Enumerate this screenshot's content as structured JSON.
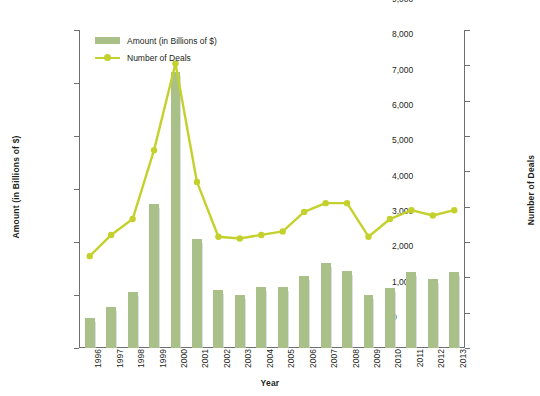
{
  "chart_data": {
    "type": "bar",
    "title": "",
    "xlabel": "Year",
    "ylabel": "Amount (in Billions of $)",
    "y2label": "Number of Deals",
    "grid": false,
    "legend_position": "top-left",
    "categories": [
      "1996",
      "1997",
      "1998",
      "1999",
      "2000",
      "2001",
      "2002",
      "2003",
      "2004",
      "2005",
      "2006",
      "2007",
      "2008",
      "2009",
      "2010",
      "2011",
      "2012",
      "2013"
    ],
    "ylim": [
      0,
      120
    ],
    "y2lim": [
      0,
      9000
    ],
    "y_ticks": [
      "$0",
      "$20",
      "$40",
      "$60",
      "$80",
      "$100",
      "$120"
    ],
    "y_tick_values": [
      0,
      20,
      40,
      60,
      80,
      100,
      120
    ],
    "y2_ticks": [
      "0",
      "1,000",
      "2,000",
      "3,000",
      "4,000",
      "5,000",
      "6,000",
      "7,000",
      "8,000",
      "9,000"
    ],
    "y2_tick_values": [
      0,
      1000,
      2000,
      3000,
      4000,
      5000,
      6000,
      7000,
      8000,
      9000
    ],
    "series": [
      {
        "name": "Amount (in Billions of $)",
        "type": "bar",
        "axis": "left",
        "color": "#a9c189",
        "values": [
          11.5,
          15.5,
          21.0,
          54.5,
          104.0,
          41.0,
          22.0,
          20.0,
          23.0,
          23.0,
          27.0,
          32.0,
          29.0,
          20.0,
          22.5,
          28.5,
          26.0,
          28.5
        ]
      },
      {
        "name": "Number of Deals",
        "type": "line",
        "axis": "right",
        "color": "#c4d12d",
        "values": [
          2600,
          3200,
          3650,
          5600,
          8050,
          4700,
          3150,
          3100,
          3200,
          3300,
          3850,
          4100,
          4100,
          3150,
          3650,
          3900,
          3750,
          3900
        ]
      }
    ]
  },
  "legend": {
    "items": [
      {
        "label": "Amount (in Billions of $)",
        "marker": "bar-swatch"
      },
      {
        "label": "Number of Deals",
        "marker": "line-marker"
      }
    ]
  },
  "axes": {
    "x_title": "Year",
    "y_left_title": "Amount (in Billions of $)",
    "y_right_title": "Number of Deals"
  }
}
